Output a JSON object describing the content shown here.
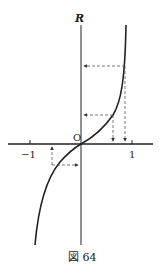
{
  "figure": {
    "caption": "図 64",
    "y_axis_label": "R",
    "origin_label": "O",
    "x_tick_labels": [
      "−1",
      "1"
    ],
    "colors": {
      "stroke": "#222222",
      "dashed": "#555555",
      "background": "#ffffff"
    }
  },
  "diagram": {
    "curve": {
      "passes_through": [
        0,
        0
      ],
      "vertical_asymptotes": [
        -1,
        1
      ]
    },
    "mappings": [
      {
        "from": "x≈0.8 on x-axis",
        "to": "R level (lower arrow)",
        "direction": "up then left"
      },
      {
        "from": "x≈0.93 on x-axis",
        "to": "R level (upper arrow)",
        "direction": "up then left"
      },
      {
        "from": "R negative level",
        "to": "x≈-0.5 on x-axis",
        "direction": "right-to-curve then up"
      }
    ]
  }
}
